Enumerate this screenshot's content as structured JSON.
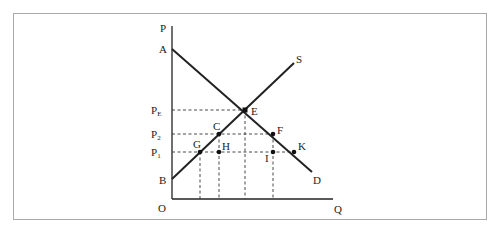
{
  "diagram": {
    "type": "supply-demand",
    "axes": {
      "y_label": "P",
      "x_label": "Q",
      "origin_label": "O"
    },
    "curves": {
      "demand": {
        "start_label": "A",
        "end_label": "D"
      },
      "supply": {
        "start_label": "B",
        "end_label": "S"
      }
    },
    "price_levels": [
      {
        "name": "P",
        "sub": "E"
      },
      {
        "name": "P",
        "sub": "2"
      },
      {
        "name": "P",
        "sub": "1"
      }
    ],
    "points": {
      "E": "E",
      "C": "C",
      "F": "F",
      "G": "G",
      "H": "H",
      "I": "I",
      "K": "K"
    }
  },
  "colors": {
    "line": "#222222",
    "dashed": "#333333",
    "frame": "#a9a9a9"
  }
}
